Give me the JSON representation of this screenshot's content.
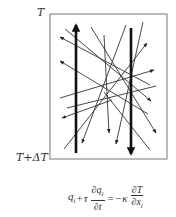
{
  "labels": {
    "top": "T",
    "bottom": "T+ΔT"
  },
  "box": {
    "x": 50,
    "y": 14,
    "width": 117,
    "height": 145,
    "stroke": "#777777"
  },
  "thick_arrows": [
    {
      "name": "up-arrow",
      "x1": 76,
      "y1": 153,
      "x2": 76,
      "y2": 25
    },
    {
      "name": "down-arrow",
      "x1": 131,
      "y1": 28,
      "x2": 131,
      "y2": 154
    }
  ],
  "thin_arrows": [
    {
      "x1": 150,
      "y1": 85,
      "x2": 60,
      "y2": 37,
      "head": true
    },
    {
      "x1": 148,
      "y1": 114,
      "x2": 60,
      "y2": 61,
      "head": true
    },
    {
      "x1": 112,
      "y1": 100,
      "x2": 62,
      "y2": 118,
      "head": true
    },
    {
      "x1": 65,
      "y1": 29,
      "x2": 151,
      "y2": 101,
      "head": true
    },
    {
      "x1": 91,
      "y1": 27,
      "x2": 156,
      "y2": 133,
      "head": true
    },
    {
      "x1": 126,
      "y1": 25,
      "x2": 82,
      "y2": 143,
      "head": true
    },
    {
      "x1": 104,
      "y1": 35,
      "x2": 109,
      "y2": 133,
      "head": true
    },
    {
      "x1": 143,
      "y1": 22,
      "x2": 116,
      "y2": 144,
      "head": true
    },
    {
      "x1": 60,
      "y1": 98,
      "x2": 154,
      "y2": 70,
      "head": true
    },
    {
      "x1": 64,
      "y1": 149,
      "x2": 147,
      "y2": 43,
      "head": true
    },
    {
      "x1": 67,
      "y1": 108,
      "x2": 156,
      "y2": 86,
      "head": false
    },
    {
      "x1": 104,
      "y1": 92,
      "x2": 150,
      "y2": 150,
      "head": false
    }
  ],
  "equation": {
    "lhs_term": "q",
    "lhs_sub": "i",
    "plus": "+",
    "tau": "τ",
    "frac1_num": "∂q",
    "frac1_num_sub": "i",
    "frac1_den": "∂t",
    "equals": "=",
    "minus_kappa": "−κ",
    "frac2_num": "∂T",
    "frac2_den": "∂x",
    "frac2_den_sub": "i"
  }
}
